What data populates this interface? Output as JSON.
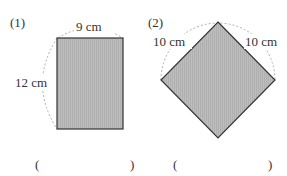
{
  "problems": [
    {
      "label": "(1)",
      "shape": "rectangle",
      "width_label": "9 cm",
      "height_label": "12 cm",
      "answer_open": "(",
      "answer_close": ")"
    },
    {
      "label": "(2)",
      "shape": "square-rotated",
      "left_side_label": "10 cm",
      "right_side_label": "10 cm",
      "answer_open": "(",
      "answer_close": ")"
    }
  ],
  "colors": {
    "fill": "#b8b8b8",
    "stroke": "#333333",
    "dashed": "#999999"
  }
}
